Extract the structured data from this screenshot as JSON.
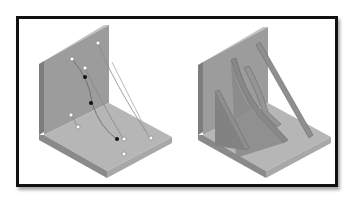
{
  "figure": {
    "panels": [
      {
        "id": "left",
        "description": "L-bracket with control points and curves",
        "points_white": 8,
        "points_black": 3
      },
      {
        "id": "right",
        "description": "L-bracket with three ribs / gussets"
      }
    ],
    "colors": {
      "frame": "#111111",
      "face_vertical": "#9a9a9a",
      "face_floor": "#b4b4b4",
      "edge_light": "#c8c8c8",
      "edge_dark": "#7a7a7a",
      "rib": "#8c8c8c",
      "rib_edge": "#6e6e6e"
    }
  }
}
